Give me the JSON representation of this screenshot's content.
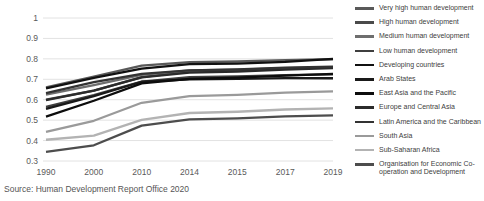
{
  "source_note": "Source: Human Development Report Office 2020",
  "legend": {
    "position": "right",
    "items": [
      {
        "label": "Very high human development",
        "color": "#595959"
      },
      {
        "label": "High human development",
        "color": "#4a4a4a"
      },
      {
        "label": "Medium human development",
        "color": "#6e6e6e"
      },
      {
        "label": "Low human development",
        "color": "#3f3f3f"
      },
      {
        "label": "Developing countries",
        "color": "#111111"
      },
      {
        "label": "Arab States",
        "color": "#1a1a1a"
      },
      {
        "label": "East Asia and the Pacific",
        "color": "#0d0d0d"
      },
      {
        "label": "Europe and Central Asia",
        "color": "#2b2b2b"
      },
      {
        "label": "Latin America and the Caribbean",
        "color": "#333333"
      },
      {
        "label": "South Asia",
        "color": "#9a9a9a"
      },
      {
        "label": "Sub-Saharan Africa",
        "color": "#b3b3b3"
      },
      {
        "label": "Organisation for Economic Co-operation and Development",
        "color": "#4d4d4d"
      }
    ]
  },
  "chart_data": {
    "type": "line",
    "title": "",
    "xlabel": "",
    "ylabel": "",
    "categories": [
      "1990",
      "2000",
      "2010",
      "2014",
      "2015",
      "2017",
      "2019"
    ],
    "yticks": [
      "0.3",
      "0.4",
      "0.5",
      "0.6",
      "0.7",
      "0.8",
      "0.9",
      "1"
    ],
    "ylim": [
      0.3,
      1.0
    ],
    "grid": true,
    "legend_position": "right",
    "series": [
      {
        "name": "Very high human development",
        "color": "#595959",
        "values": [
          0.661,
          0.713,
          0.767,
          0.784,
          0.787,
          0.794,
          0.798
        ]
      },
      {
        "name": "High human development",
        "color": "#4a4a4a",
        "values": [
          0.6,
          0.645,
          0.711,
          0.737,
          0.742,
          0.752,
          0.758
        ]
      },
      {
        "name": "Medium human development",
        "color": "#6e6e6e",
        "values": [
          0.625,
          0.672,
          0.722,
          0.743,
          0.747,
          0.755,
          0.76
        ]
      },
      {
        "name": "Low human development",
        "color": "#3f3f3f",
        "values": [
          0.565,
          0.622,
          0.689,
          0.71,
          0.714,
          0.72,
          0.724
        ]
      },
      {
        "name": "Developing countries",
        "color": "#111111",
        "values": [
          0.656,
          0.707,
          0.752,
          0.774,
          0.777,
          0.785,
          0.8
        ]
      },
      {
        "name": "Arab States",
        "color": "#1a1a1a",
        "values": [
          0.555,
          0.618,
          0.688,
          0.7,
          0.702,
          0.706,
          0.705
        ]
      },
      {
        "name": "East Asia and the Pacific",
        "color": "#0d0d0d",
        "values": [
          0.517,
          0.595,
          0.68,
          0.702,
          0.708,
          0.718,
          0.726
        ]
      },
      {
        "name": "Europe and Central Asia",
        "color": "#2b2b2b",
        "values": [
          0.598,
          0.645,
          0.709,
          0.733,
          0.738,
          0.748,
          0.755
        ]
      },
      {
        "name": "Latin America and the Caribbean",
        "color": "#333333",
        "values": [
          0.632,
          0.686,
          0.726,
          0.744,
          0.748,
          0.757,
          0.762
        ]
      },
      {
        "name": "South Asia",
        "color": "#9a9a9a",
        "values": [
          0.442,
          0.497,
          0.585,
          0.618,
          0.624,
          0.635,
          0.641
        ]
      },
      {
        "name": "Sub-Saharan Africa",
        "color": "#b3b3b3",
        "values": [
          0.404,
          0.424,
          0.501,
          0.535,
          0.541,
          0.552,
          0.558
        ]
      },
      {
        "name": "Organisation for Economic Co-operation and Development",
        "color": "#4d4d4d",
        "values": [
          0.345,
          0.377,
          0.473,
          0.504,
          0.509,
          0.518,
          0.523
        ]
      }
    ]
  }
}
